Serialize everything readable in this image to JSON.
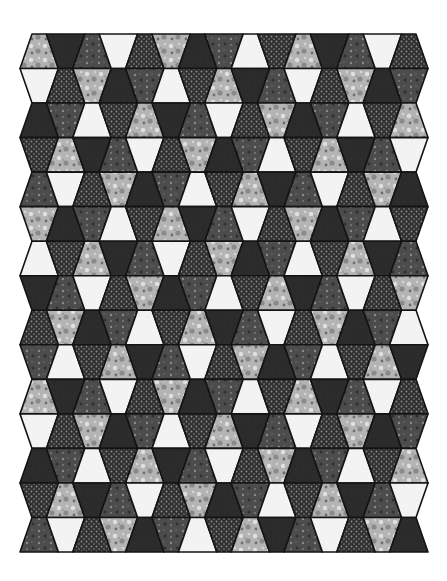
{
  "image": {
    "subject": "Tumbler patchwork quilt",
    "width": 447,
    "height": 581
  },
  "quilt": {
    "rows": 15,
    "columns": 15,
    "left": 26,
    "right": 422,
    "top": 34,
    "bottom": 552,
    "narrow_inset": 6,
    "outline_color": "#141414",
    "fabric_cycle": [
      "floral-light",
      "dark-solid",
      "gray-floral",
      "white-solid",
      "polka-dot"
    ],
    "row_start_offsets": [
      0,
      3,
      1,
      4,
      2
    ],
    "fabrics": {
      "floral-light": {
        "base": "#b4b4b4",
        "accent": "#7a7a7a",
        "highlight": "#e0e0e0"
      },
      "dark-solid": {
        "base": "#2b2b2b",
        "accent": "#232323",
        "highlight": "#333333"
      },
      "gray-floral": {
        "base": "#4c4c4c",
        "accent": "#2f2f2f",
        "highlight": "#8a8a8a"
      },
      "white-solid": {
        "base": "#f3f3f3",
        "accent": "#e6e6e6",
        "highlight": "#ffffff"
      },
      "polka-dot": {
        "base": "#303030",
        "accent": "#303030",
        "highlight": "#8c8c8c"
      }
    }
  }
}
